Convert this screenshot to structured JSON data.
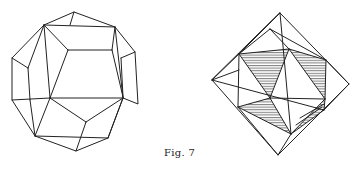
{
  "figure": {
    "caption": "Fig. 7",
    "stroke_color": "#222222",
    "hatch_color": "#333333",
    "background": "#ffffff"
  },
  "left_figure": {
    "label": "dodecahedron",
    "vertices": [
      [
        74,
        12
      ],
      [
        45,
        26
      ],
      [
        115,
        28
      ],
      [
        70,
        25
      ],
      [
        12,
        58
      ],
      [
        28,
        68
      ],
      [
        68,
        50
      ],
      [
        120,
        50
      ],
      [
        135,
        52
      ],
      [
        138,
        105
      ],
      [
        123,
        97
      ],
      [
        50,
        98
      ],
      [
        86,
        122
      ],
      [
        14,
        100
      ],
      [
        35,
        136
      ],
      [
        108,
        138
      ],
      [
        76,
        151
      ],
      [
        28,
        100
      ]
    ]
  },
  "right_figure": {
    "label": "octahedron-with-inscribed-icosahedron",
    "outer_vertices": {
      "top": [
        280,
        13
      ],
      "left": [
        212,
        80
      ],
      "right": [
        349,
        84
      ],
      "bottom": [
        278,
        155
      ]
    }
  }
}
